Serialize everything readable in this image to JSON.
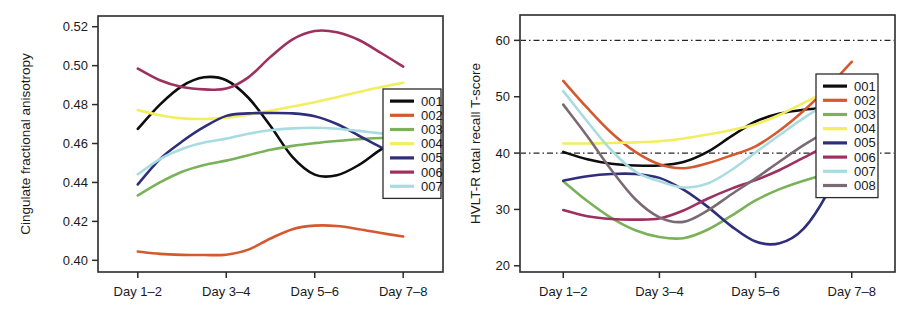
{
  "figure": {
    "panel_count": 2
  },
  "chart_data": [
    {
      "id": "left",
      "type": "line",
      "title": "",
      "xlabel": "",
      "ylabel": "Cingulate fractional anisotropy",
      "categories": [
        "Day 1–2",
        "Day 3–4",
        "Day 5–6",
        "Day 7–8"
      ],
      "xtick_labels": [
        "Day 1–2",
        "Day 3–4",
        "Day 5–6",
        "Day 7–8"
      ],
      "ytick_labels": [
        "0.52",
        "0.50",
        "0.48",
        "0.46",
        "0.44",
        "0.42",
        "0.40"
      ],
      "ytick_values": [
        0.52,
        0.5,
        0.48,
        0.46,
        0.44,
        0.42,
        0.4
      ],
      "ylim": [
        0.394,
        0.5255
      ],
      "xlim": [
        0.55,
        4.45
      ],
      "grid": false,
      "reference_lines": [],
      "legend_position": "right-middle",
      "series": [
        {
          "name": "001",
          "color": "#0d0d0d",
          "values": [
            0.4675,
            0.4925,
            0.4435,
            0.4635
          ],
          "dense_x": [
            1.0,
            1.25,
            1.5,
            1.75,
            2.0,
            2.25,
            2.5,
            2.75,
            3.0,
            3.25,
            3.5,
            3.75,
            4.0
          ],
          "dense_y": [
            0.4675,
            0.48,
            0.4895,
            0.494,
            0.4925,
            0.4835,
            0.469,
            0.453,
            0.444,
            0.4437,
            0.449,
            0.457,
            0.4635
          ]
        },
        {
          "name": "002",
          "color": "#d4592f",
          "values": [
            0.4045,
            0.4028,
            0.4178,
            0.4122
          ],
          "dense_x": [
            1.0,
            1.25,
            1.5,
            1.75,
            2.0,
            2.25,
            2.5,
            2.75,
            3.0,
            3.25,
            3.5,
            3.75,
            4.0
          ],
          "dense_y": [
            0.4045,
            0.4033,
            0.4028,
            0.4027,
            0.4029,
            0.4055,
            0.4112,
            0.416,
            0.4178,
            0.4176,
            0.416,
            0.414,
            0.4122
          ]
        },
        {
          "name": "003",
          "color": "#7ab25a",
          "values": [
            0.4333,
            0.451,
            0.46,
            0.4632
          ],
          "dense_x": [
            1.0,
            1.25,
            1.5,
            1.75,
            2.0,
            2.25,
            2.5,
            2.75,
            3.0,
            3.25,
            3.5,
            3.75,
            4.0
          ],
          "dense_y": [
            0.4333,
            0.44,
            0.4455,
            0.449,
            0.4512,
            0.454,
            0.4568,
            0.4588,
            0.4602,
            0.4613,
            0.4622,
            0.4628,
            0.4632
          ]
        },
        {
          "name": "004",
          "color": "#f2ee5e",
          "values": [
            0.4772,
            0.473,
            0.479,
            0.4912
          ],
          "dense_x": [
            1.0,
            1.25,
            1.5,
            1.75,
            2.0,
            2.25,
            2.5,
            2.75,
            3.0,
            3.25,
            3.5,
            3.75,
            4.0
          ],
          "dense_y": [
            0.4772,
            0.4745,
            0.4729,
            0.4726,
            0.4733,
            0.4748,
            0.4768,
            0.479,
            0.4812,
            0.4838,
            0.4865,
            0.489,
            0.4912
          ]
        },
        {
          "name": "005",
          "color": "#2e2e7a",
          "values": [
            0.439,
            0.4748,
            0.475,
            0.4528
          ],
          "dense_x": [
            1.0,
            1.25,
            1.5,
            1.75,
            2.0,
            2.25,
            2.5,
            2.75,
            3.0,
            3.25,
            3.5,
            3.75,
            4.0
          ],
          "dense_y": [
            0.439,
            0.452,
            0.461,
            0.4685,
            0.4742,
            0.4755,
            0.4757,
            0.4755,
            0.474,
            0.47,
            0.464,
            0.458,
            0.4528
          ]
        },
        {
          "name": "006",
          "color": "#9e3060",
          "values": [
            0.4985,
            0.488,
            0.5178,
            0.4995
          ],
          "dense_x": [
            1.0,
            1.25,
            1.5,
            1.75,
            2.0,
            2.25,
            2.5,
            2.75,
            3.0,
            3.25,
            3.5,
            3.75,
            4.0
          ],
          "dense_y": [
            0.4985,
            0.4925,
            0.489,
            0.4878,
            0.4882,
            0.494,
            0.5045,
            0.5135,
            0.5178,
            0.5172,
            0.5132,
            0.5065,
            0.4995
          ]
        },
        {
          "name": "007",
          "color": "#a9dce0",
          "values": [
            0.4442,
            0.462,
            0.468,
            0.464
          ],
          "dense_x": [
            1.0,
            1.25,
            1.5,
            1.75,
            2.0,
            2.25,
            2.5,
            2.75,
            3.0,
            3.25,
            3.5,
            3.75,
            4.0
          ],
          "dense_y": [
            0.4442,
            0.452,
            0.4572,
            0.4605,
            0.4625,
            0.465,
            0.4668,
            0.4678,
            0.4681,
            0.4676,
            0.4665,
            0.4652,
            0.464
          ]
        }
      ]
    },
    {
      "id": "right",
      "type": "line",
      "title": "",
      "xlabel": "",
      "ylabel": "HVLT-R total recall T-score",
      "categories": [
        "Day 1–2",
        "Day 3–4",
        "Day 5–6",
        "Day 7–8"
      ],
      "xtick_labels": [
        "Day 1–2",
        "Day 3–4",
        "Day 5–6",
        "Day 7–8"
      ],
      "ytick_labels": [
        "60",
        "50",
        "40",
        "30",
        "20"
      ],
      "ytick_values": [
        60,
        50,
        40,
        30,
        20
      ],
      "ylim": [
        18.9,
        64.5
      ],
      "xlim": [
        0.55,
        4.45
      ],
      "grid": false,
      "reference_lines": [
        {
          "y": 60,
          "style": "dash-dot"
        },
        {
          "y": 40,
          "style": "dash-dot"
        }
      ],
      "legend_position": "right-middle",
      "series": [
        {
          "name": "001",
          "color": "#0d0d0d",
          "values": [
            40.2,
            37.8,
            47.0,
            48.2
          ],
          "dense_x": [
            1.0,
            1.25,
            1.5,
            1.75,
            2.0,
            2.25,
            2.5,
            2.75,
            3.0,
            3.25,
            3.5,
            3.75,
            4.0
          ],
          "dense_y": [
            40.2,
            38.9,
            38.1,
            37.8,
            37.8,
            38.4,
            40.2,
            43.0,
            45.6,
            47.0,
            47.7,
            48.0,
            48.2
          ]
        },
        {
          "name": "002",
          "color": "#d4592f",
          "values": [
            52.8,
            37.8,
            41.0,
            56.2
          ],
          "dense_x": [
            1.0,
            1.25,
            1.5,
            1.75,
            2.0,
            2.25,
            2.5,
            2.75,
            3.0,
            3.25,
            3.5,
            3.75,
            4.0
          ],
          "dense_y": [
            52.8,
            48.0,
            43.6,
            40.2,
            38.0,
            37.3,
            38.2,
            39.6,
            41.2,
            44.0,
            47.5,
            51.6,
            56.2
          ]
        },
        {
          "name": "003",
          "color": "#7ab25a",
          "values": [
            35.0,
            25.0,
            31.6,
            37.2
          ],
          "dense_x": [
            1.0,
            1.25,
            1.5,
            1.75,
            2.0,
            2.25,
            2.5,
            2.75,
            3.0,
            3.25,
            3.5,
            3.75,
            4.0
          ],
          "dense_y": [
            35.0,
            31.5,
            28.5,
            26.3,
            25.1,
            24.9,
            26.4,
            28.9,
            31.6,
            33.6,
            35.1,
            36.3,
            37.2
          ]
        },
        {
          "name": "004",
          "color": "#f2ee5e",
          "values": [
            41.7,
            42.0,
            45.0,
            53.0
          ],
          "dense_x": [
            1.0,
            1.25,
            1.5,
            1.75,
            2.0,
            2.25,
            2.5,
            2.75,
            3.0,
            3.25,
            3.5,
            3.75,
            4.0
          ],
          "dense_y": [
            41.7,
            41.7,
            41.8,
            41.9,
            42.1,
            42.6,
            43.3,
            44.1,
            45.1,
            46.8,
            48.9,
            51.0,
            53.0
          ]
        },
        {
          "name": "005",
          "color": "#2e2e7a",
          "values": [
            35.1,
            36.1,
            24.0,
            42.3
          ],
          "dense_x": [
            1.0,
            1.25,
            1.5,
            1.75,
            2.0,
            2.25,
            2.5,
            2.75,
            3.0,
            3.25,
            3.5,
            3.75,
            4.0
          ],
          "dense_y": [
            35.1,
            35.9,
            36.3,
            36.3,
            35.6,
            33.5,
            30.5,
            27.0,
            24.3,
            24.0,
            26.6,
            33.0,
            42.3
          ]
        },
        {
          "name": "006",
          "color": "#9e3060",
          "values": [
            29.9,
            28.4,
            35.0,
            43.0
          ],
          "dense_x": [
            1.0,
            1.25,
            1.5,
            1.75,
            2.0,
            2.25,
            2.5,
            2.75,
            3.0,
            3.25,
            3.5,
            3.75,
            4.0
          ],
          "dense_y": [
            29.9,
            28.8,
            28.3,
            28.2,
            28.4,
            29.8,
            31.9,
            33.7,
            35.2,
            37.0,
            39.2,
            41.3,
            43.0
          ]
        },
        {
          "name": "007",
          "color": "#a9dce0",
          "values": [
            51.0,
            35.0,
            40.0,
            51.0
          ],
          "dense_x": [
            1.0,
            1.25,
            1.5,
            1.75,
            2.0,
            2.25,
            2.5,
            2.75,
            3.0,
            3.25,
            3.5,
            3.75,
            4.0
          ],
          "dense_y": [
            51.0,
            45.6,
            40.5,
            36.7,
            35.0,
            33.9,
            34.6,
            37.0,
            40.1,
            43.2,
            46.2,
            48.8,
            51.0
          ]
        },
        {
          "name": "008",
          "color": "#7a6a74",
          "values": [
            48.6,
            28.3,
            35.4,
            45.9
          ],
          "dense_x": [
            1.0,
            1.25,
            1.5,
            1.75,
            2.0,
            2.25,
            2.5,
            2.75,
            3.0,
            3.25,
            3.5,
            3.75,
            4.0
          ],
          "dense_y": [
            48.6,
            43.0,
            37.0,
            31.8,
            28.6,
            27.8,
            29.8,
            32.7,
            35.5,
            38.5,
            41.4,
            43.9,
            45.9
          ]
        }
      ]
    }
  ]
}
